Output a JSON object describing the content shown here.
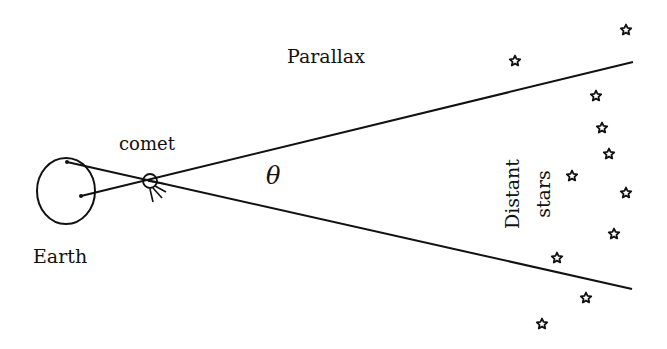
{
  "labels": {
    "title": "Parallax",
    "comet": "comet",
    "earth": "Earth",
    "angle": "θ",
    "stars_line1": "Distant",
    "stars_line2": "stars"
  },
  "colors": {
    "ink": "#111111",
    "background": "#ffffff"
  },
  "geometry": {
    "earth": {
      "cx": 66,
      "cy": 191,
      "rx": 29,
      "ry": 33
    },
    "observer_points": [
      [
        67,
        162
      ],
      [
        81,
        196
      ]
    ],
    "comet": {
      "cx": 150,
      "cy": 181,
      "r": 7
    },
    "sight_line_upper_end": [
      633,
      62
    ],
    "sight_line_lower_end": [
      632,
      289
    ]
  },
  "stars": [
    [
      515,
      61
    ],
    [
      626,
      30
    ],
    [
      596,
      96
    ],
    [
      602,
      128
    ],
    [
      609,
      154
    ],
    [
      572,
      176
    ],
    [
      626,
      193
    ],
    [
      614,
      234
    ],
    [
      557,
      258
    ],
    [
      586,
      298
    ],
    [
      542,
      324
    ]
  ]
}
